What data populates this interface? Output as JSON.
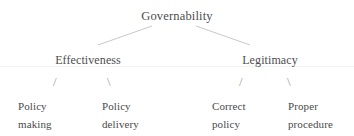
{
  "diagram": {
    "type": "hierarchy-tree",
    "background_color": "#ffffff",
    "text_color": "#4d4d4d",
    "line_color": "#c9c9c9",
    "root": {
      "label": "Governability"
    },
    "branches": [
      {
        "label": "Effectiveness",
        "children": [
          {
            "line1": "Policy",
            "line2": "making",
            "connector": "/"
          },
          {
            "line1": "Policy",
            "line2": "delivery",
            "connector": "\\"
          }
        ]
      },
      {
        "label": "Legitimacy",
        "children": [
          {
            "line1": "Correct",
            "line2": "policy",
            "connector": "/"
          },
          {
            "line1": "Proper",
            "line2": "procedure",
            "connector": "\\"
          }
        ]
      }
    ]
  }
}
